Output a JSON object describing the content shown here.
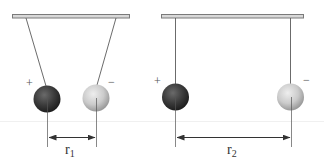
{
  "figure": {
    "colors": {
      "bar_fill": "#d8d8d8",
      "bar_stroke": "#7a7a7a",
      "string": "#5a5a5a",
      "positive_sphere": "#3a3a3a",
      "negative_sphere": "#c8c8c8",
      "dimension_line": "#333333"
    },
    "panels": [
      {
        "id": "close",
        "positive_label": "+",
        "negative_label": "−",
        "distance_label": "r",
        "distance_subscript": "1"
      },
      {
        "id": "far",
        "positive_label": "+",
        "negative_label": "−",
        "distance_label": "r",
        "distance_subscript": "2"
      }
    ]
  }
}
